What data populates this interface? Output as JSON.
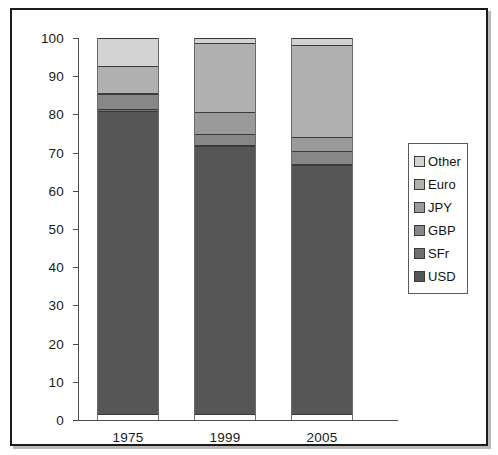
{
  "figure": {
    "frame_color": "#1b1b1b",
    "background": "#ffffff"
  },
  "legend": {
    "position": "right",
    "entries": [
      {
        "label": "Other",
        "color": "#d2d2d2"
      },
      {
        "label": "Euro",
        "color": "#b0b0b0"
      },
      {
        "label": "JPY",
        "color": "#9a9a9a"
      },
      {
        "label": "GBP",
        "color": "#878787"
      },
      {
        "label": "SFr",
        "color": "#6f6f6f"
      },
      {
        "label": "USD",
        "color": "#565656"
      }
    ]
  },
  "axes": {
    "y_ticks": [
      "0",
      "10",
      "20",
      "30",
      "40",
      "50",
      "60",
      "70",
      "80",
      "90",
      "100"
    ],
    "x_ticks": [
      "1975",
      "1999",
      "2005"
    ]
  },
  "chart_data": {
    "type": "bar",
    "subtype": "stacked-bar-100-percent",
    "title": "",
    "subtitle": "",
    "xlabel": "",
    "ylabel": "",
    "ylim": [
      0,
      100
    ],
    "ytick_step": 10,
    "grid": false,
    "legend_position": "right",
    "categories": [
      "1975",
      "1999",
      "2005"
    ],
    "stack_order_bottom_to_top": [
      "USD",
      "SFr",
      "GBP",
      "JPY",
      "Euro",
      "Other"
    ],
    "series": [
      {
        "name": "USD",
        "color": "#565656",
        "values": [
          79.5,
          70.5,
          65.5
        ]
      },
      {
        "name": "SFr",
        "color": "#6f6f6f",
        "values": [
          1.0,
          0.5,
          0.5
        ]
      },
      {
        "name": "GBP",
        "color": "#878787",
        "values": [
          4.0,
          3.0,
          3.5
        ]
      },
      {
        "name": "JPY",
        "color": "#9a9a9a",
        "values": [
          0.5,
          6.0,
          4.0
        ]
      },
      {
        "name": "Euro",
        "color": "#b0b0b0",
        "values": [
          7.5,
          18.5,
          24.5
        ]
      },
      {
        "name": "Other",
        "color": "#d2d2d2",
        "values": [
          7.5,
          1.5,
          2.0
        ]
      }
    ],
    "cumulative_tops": {
      "1975": {
        "USD": 79.5,
        "SFr": 80.5,
        "GBP": 84.5,
        "JPY": 85.0,
        "Euro": 92.5,
        "Other": 100.0
      },
      "1999": {
        "USD": 70.5,
        "SFr": 71.0,
        "GBP": 74.0,
        "JPY": 80.0,
        "Euro": 98.5,
        "Other": 100.0
      },
      "2005": {
        "USD": 65.5,
        "SFr": 66.0,
        "GBP": 69.5,
        "JPY": 73.5,
        "Euro": 98.0,
        "Other": 100.0
      }
    }
  }
}
